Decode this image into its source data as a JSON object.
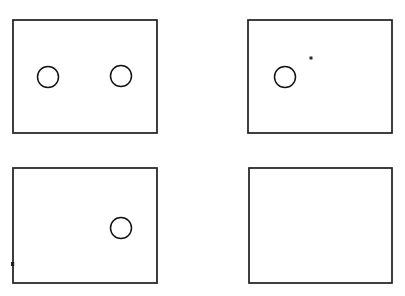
{
  "figure": {
    "title": "Four panel diagram with circles",
    "background_color": "#ffffff",
    "stroke_color": "#1e1e1e",
    "circle_stroke_color": "#141414",
    "width": 405,
    "height": 296,
    "panel_count": 4,
    "total_circle_count": 4
  },
  "panels": [
    {
      "id": "panel-top-left",
      "label": "Top left panel",
      "position": "top-left",
      "x": 13,
      "y": 20,
      "width": 144,
      "height": 113,
      "circle_count": 2,
      "circles": [
        {
          "id": "circle-tl-left",
          "label": "Left circle",
          "cx": 48,
          "cy": 77,
          "rx": 10.5,
          "ry": 10.5
        },
        {
          "id": "circle-tl-right",
          "label": "Right circle",
          "cx": 121,
          "cy": 76,
          "rx": 10.5,
          "ry": 10.5
        }
      ],
      "marks": []
    },
    {
      "id": "panel-top-right",
      "label": "Top right panel",
      "position": "top-right",
      "x": 248,
      "y": 20,
      "width": 144,
      "height": 113,
      "circle_count": 1,
      "circles": [
        {
          "id": "circle-tr-left",
          "label": "Left circle",
          "cx": 285,
          "cy": 77,
          "rx": 10.5,
          "ry": 10.5
        }
      ],
      "marks": [
        {
          "id": "speck-tr",
          "label": "Small speck mark",
          "cx": 311,
          "cy": 58,
          "size": 3
        }
      ]
    },
    {
      "id": "panel-bottom-left",
      "label": "Bottom left panel",
      "position": "bottom-left",
      "x": 13,
      "y": 168,
      "width": 144,
      "height": 115,
      "circle_count": 1,
      "circles": [
        {
          "id": "circle-bl-right",
          "label": "Right circle",
          "cx": 121,
          "cy": 228,
          "rx": 10.5,
          "ry": 10.5
        }
      ],
      "marks": [
        {
          "id": "nick-bl",
          "label": "Edge nick on left border",
          "cx": 13,
          "cy": 264,
          "size": 4
        }
      ]
    },
    {
      "id": "panel-bottom-right",
      "label": "Bottom right panel",
      "position": "bottom-right",
      "x": 249,
      "y": 168,
      "width": 143,
      "height": 115,
      "circle_count": 0,
      "circles": [],
      "marks": []
    }
  ]
}
